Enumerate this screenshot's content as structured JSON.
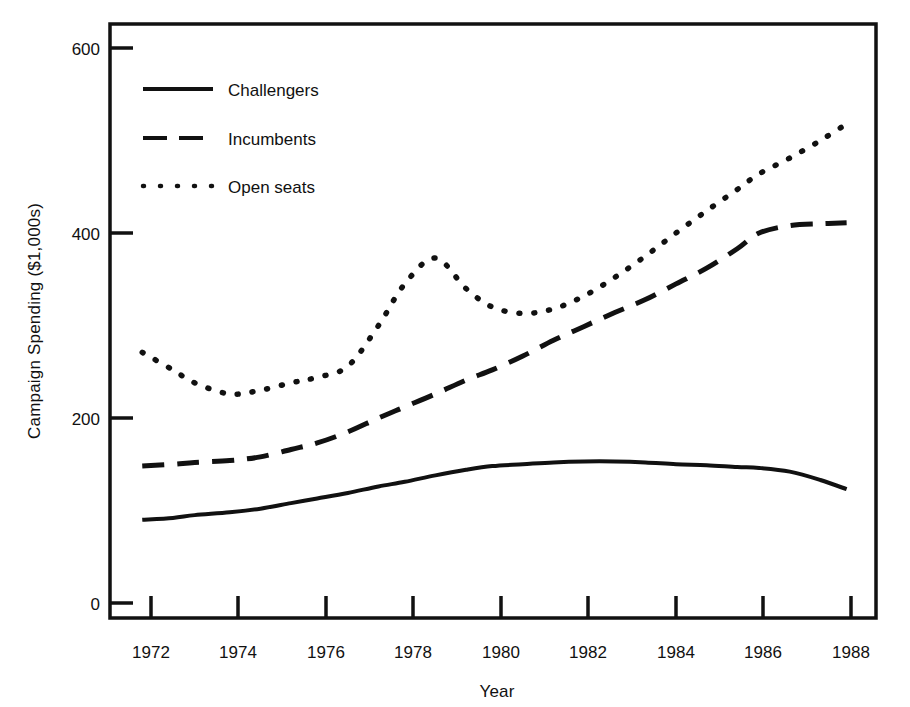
{
  "chart_data": {
    "type": "line",
    "title": "",
    "xlabel": "Year",
    "ylabel": "Campaign Spending ($1,000s)",
    "xlim": [
      1971,
      1989
    ],
    "ylim": [
      0,
      640
    ],
    "xticks": [
      1972,
      1974,
      1976,
      1978,
      1980,
      1982,
      1984,
      1986,
      1988
    ],
    "xticklabels": [
      "1972",
      "1974",
      "1976",
      "1978",
      "1980",
      "1982",
      "1984",
      "1986",
      "1988"
    ],
    "yticks": [
      0,
      200,
      400,
      600
    ],
    "yticklabels": [
      "0",
      "200",
      "400",
      "600"
    ],
    "grid": false,
    "legend_position": "upper-left-inside",
    "x": [
      1971.8,
      1972.5,
      1973.0,
      1973.8,
      1974.5,
      1975.2,
      1975.8,
      1976.5,
      1977.2,
      1977.8,
      1978.5,
      1979.2,
      1979.8,
      1980.5,
      1981.2,
      1981.9,
      1982.6,
      1983.3,
      1984.0,
      1984.7,
      1985.4,
      1985.9,
      1986.6,
      1987.3,
      1987.9
    ],
    "series": [
      {
        "name": "Challengers",
        "style": "solid",
        "color": "#111111",
        "values": [
          90,
          92,
          95,
          98,
          102,
          108,
          113,
          119,
          126,
          131,
          138,
          144,
          148,
          150,
          152,
          153,
          153,
          152,
          150,
          149,
          147,
          146,
          142,
          133,
          123
        ]
      },
      {
        "name": "Incumbents",
        "style": "dashed",
        "color": "#111111",
        "values": [
          148,
          150,
          152,
          154,
          158,
          166,
          173,
          185,
          200,
          212,
          226,
          241,
          252,
          267,
          284,
          299,
          314,
          328,
          345,
          362,
          383,
          400,
          408,
          410,
          411
        ]
      },
      {
        "name": "Open seats",
        "style": "dotted",
        "color": "#111111",
        "values": [
          271,
          252,
          238,
          226,
          230,
          238,
          244,
          256,
          300,
          345,
          373,
          340,
          320,
          313,
          318,
          332,
          352,
          375,
          400,
          424,
          447,
          464,
          481,
          500,
          518
        ]
      }
    ]
  },
  "legend": {
    "entries": [
      {
        "label": "Challengers",
        "swatch": "solid-line-swatch"
      },
      {
        "label": "Incumbents",
        "swatch": "dashed-line-swatch"
      },
      {
        "label": "Open seats",
        "swatch": "dotted-line-swatch"
      }
    ]
  },
  "axes": {
    "y_axis_title": "Campaign Spending ($1,000s)",
    "x_axis_title": "Year"
  }
}
